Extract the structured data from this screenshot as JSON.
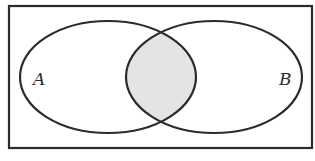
{
  "diagram": {
    "type": "venn",
    "title": "",
    "universe": {
      "x": 9,
      "y": 6,
      "width": 303,
      "height": 142
    },
    "sets": [
      {
        "label": "A",
        "cx": 108,
        "cy": 77,
        "rx": 88,
        "ry": 56
      },
      {
        "label": "B",
        "cx": 214,
        "cy": 77,
        "rx": 88,
        "ry": 56
      }
    ],
    "shaded_region": "A ∩ B",
    "colors": {
      "stroke": "#2b2b2b",
      "shade": "#e4e4e4",
      "background": "#ffffff"
    }
  }
}
